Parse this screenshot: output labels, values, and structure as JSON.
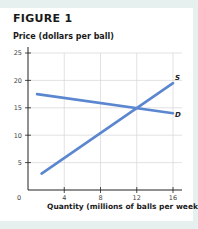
{
  "figure": {
    "title": "FIGURE 1",
    "ylabel": "Price (dollars per ball)",
    "xlabel": "Quantity (millions of balls per week)"
  },
  "colors": {
    "line": "#5b86d0",
    "grid": "#d6d6d6",
    "axis": "#222222",
    "background": "#e6f1ef"
  },
  "chart_data": {
    "type": "line",
    "title": "FIGURE 1",
    "xlabel": "Quantity (millions of balls per week)",
    "ylabel": "Price (dollars per ball)",
    "xlim": [
      0,
      17
    ],
    "ylim": [
      0,
      26
    ],
    "x_ticks": [
      0,
      4,
      8,
      12,
      16
    ],
    "y_ticks": [
      5,
      10,
      15,
      20,
      25
    ],
    "grid": true,
    "series": [
      {
        "name": "S",
        "label": "S",
        "points": [
          [
            1.5,
            3
          ],
          [
            16,
            19.5
          ]
        ]
      },
      {
        "name": "D",
        "label": "D",
        "points": [
          [
            1,
            17.5
          ],
          [
            16,
            14
          ]
        ]
      }
    ],
    "annotations": [
      "S",
      "D"
    ],
    "equilibrium": {
      "quantity": 12,
      "price": 15
    }
  }
}
